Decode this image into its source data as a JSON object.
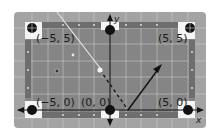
{
  "diagram": {
    "type": "pool-table-coordinate-diagram",
    "axes": {
      "x_label": "x",
      "y_label": "y"
    },
    "pockets": [
      {
        "label": "(−5, 5)",
        "x": -5,
        "y": 5
      },
      {
        "label": "(5, 5)",
        "x": 5,
        "y": 5
      },
      {
        "label": "(−5, 0)",
        "x": -5,
        "y": 0
      },
      {
        "label": "(0, 0)",
        "x": 0,
        "y": 0
      },
      {
        "label": "(5, 0)",
        "x": 5,
        "y": 0
      },
      {
        "label": "",
        "x": 0,
        "y": 5
      }
    ],
    "colors": {
      "table_rail": "#9a9a9a",
      "felt": "#7d7d7d",
      "grid": "#d6d6d6",
      "pocket": "#111111",
      "axis": "#111111",
      "arrow": "#111111",
      "ball_white": "#f2f2f2"
    }
  }
}
